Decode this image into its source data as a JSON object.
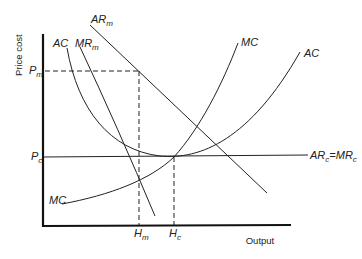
{
  "diagram": {
    "type": "economics-cost-revenue",
    "axes": {
      "y_title": "Price cost",
      "x_title": "Output"
    },
    "price_labels": {
      "pm": {
        "main": "P",
        "sub": "m"
      },
      "pc": {
        "main": "P",
        "sub": "c"
      }
    },
    "quantity_labels": {
      "hm": {
        "main": "H",
        "sub": "m"
      },
      "hc": {
        "main": "H",
        "sub": "c"
      }
    },
    "curve_labels": {
      "ar_m": {
        "main": "AR",
        "sub": "m"
      },
      "mr_m": {
        "main": "MR",
        "sub": "m"
      },
      "ac_left": "AC",
      "ac_right": "AC",
      "mc_top": "MC",
      "mc_bottom": "MC",
      "arc_mrc": {
        "a": "AR",
        "a_sub": "c",
        "eq": "=",
        "b": "MR",
        "b_sub": "c"
      }
    },
    "colors": {
      "line": "#222222",
      "axis": "#111111",
      "background": "#ffffff"
    }
  }
}
